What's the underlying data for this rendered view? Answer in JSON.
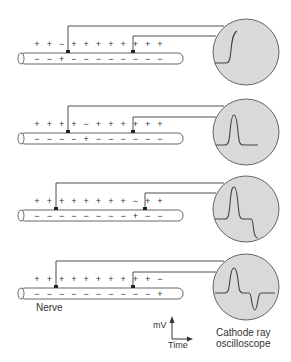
{
  "labels": {
    "nerve": "Nerve",
    "oscilloscope": "Cathode ray oscilloscope",
    "oscilloscope_line1": "Cathode ray",
    "oscilloscope_line2": "oscilloscope",
    "axis_y": "mV",
    "axis_x": "Time"
  },
  "colors": {
    "line": "#3a3a3a",
    "screen_fill": "#d9d9d9",
    "screen_border": "#555555",
    "tube_border": "#555555",
    "text": "#333333"
  },
  "panels": [
    {
      "outside_charges": [
        "+",
        "+",
        "−",
        "+",
        "+",
        "+",
        "+",
        "+",
        "+",
        "+",
        "+"
      ],
      "inside_charges": [
        "−",
        "−",
        "+",
        "−",
        "−",
        "−",
        "−",
        "−",
        "−",
        "−",
        "−"
      ],
      "trace": "upstroke"
    },
    {
      "outside_charges": [
        "+",
        "+",
        "+",
        "+",
        "−",
        "+",
        "+",
        "+",
        "+",
        "+",
        "+"
      ],
      "inside_charges": [
        "−",
        "−",
        "−",
        "−",
        "+",
        "−",
        "−",
        "−",
        "−",
        "−",
        "−"
      ],
      "trace": "positive peak returning to baseline"
    },
    {
      "outside_charges": [
        "+",
        "+",
        "+",
        "+",
        "+",
        "+",
        "+",
        "+",
        "−",
        "+",
        "+"
      ],
      "inside_charges": [
        "−",
        "−",
        "−",
        "−",
        "−",
        "−",
        "−",
        "−",
        "+",
        "−",
        "−"
      ],
      "trace": "positive peak then negative deflection"
    },
    {
      "outside_charges": [
        "+",
        "+",
        "+",
        "+",
        "+",
        "+",
        "+",
        "+",
        "+",
        "+",
        "−"
      ],
      "inside_charges": [
        "−",
        "−",
        "−",
        "−",
        "−",
        "−",
        "−",
        "−",
        "−",
        "−",
        "+"
      ],
      "trace": "complete biphasic waveform"
    }
  ]
}
